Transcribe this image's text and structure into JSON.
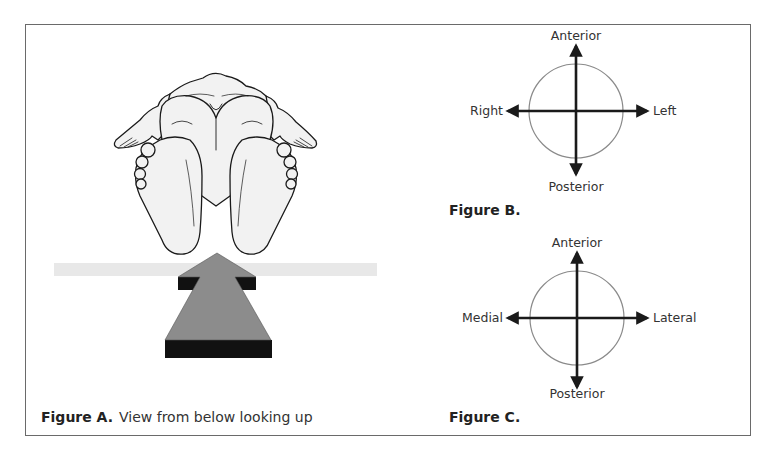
{
  "figures": {
    "a": {
      "label": "Figure A.",
      "description": "View from below looking up",
      "illustration": "infant-feet-view-from-below",
      "arrow_direction": "up",
      "colors": {
        "arrow_face": "#8c8c8c",
        "arrow_shadow": "#111111",
        "surface_bar": "#e8e8e8",
        "skin_fill": "#f2f2f2",
        "outline": "#1a1a1a"
      }
    },
    "b": {
      "label": "Figure B.",
      "axes": {
        "top": "Anterior",
        "bottom": "Posterior",
        "left": "Right",
        "right": "Left"
      },
      "colors": {
        "circle": "#8a8a8a",
        "axis": "#1a1a1a"
      }
    },
    "c": {
      "label": "Figure C.",
      "axes": {
        "top": "Anterior",
        "bottom": "Posterior",
        "left": "Medial",
        "right": "Lateral"
      },
      "colors": {
        "circle": "#8a8a8a",
        "axis": "#1a1a1a"
      }
    }
  },
  "frame": {
    "border_color": "#6a6a6a"
  }
}
